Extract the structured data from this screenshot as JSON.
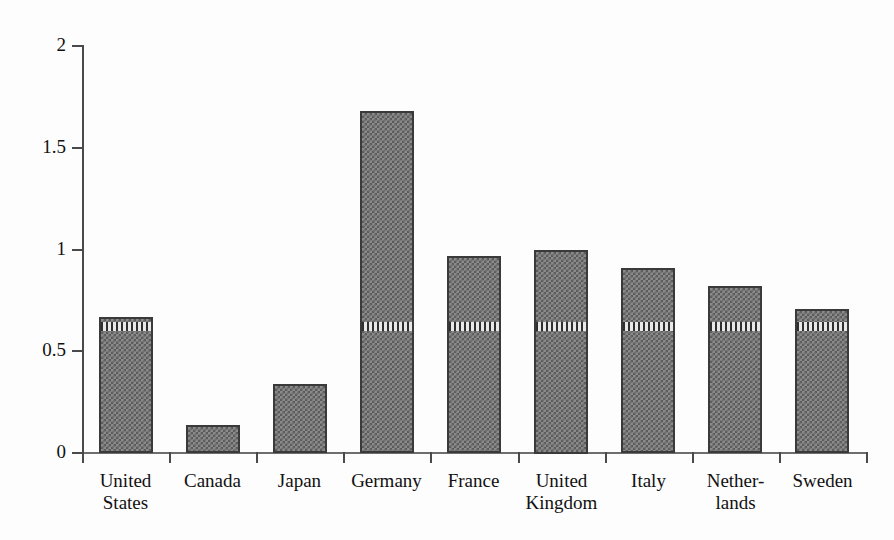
{
  "chart_data": {
    "type": "bar",
    "title": "",
    "subtitle": "",
    "xlabel": "",
    "ylabel": "",
    "categories": [
      "United\nStates",
      "Canada",
      "Japan",
      "Germany",
      "France",
      "United\nKingdom",
      "Italy",
      "Nether-\nlands",
      "Sweden"
    ],
    "values": [
      0.67,
      0.14,
      0.34,
      1.68,
      0.97,
      1.0,
      0.91,
      0.82,
      0.71
    ],
    "series": [
      {
        "name": "value",
        "values": [
          0.67,
          0.14,
          0.34,
          1.68,
          0.97,
          1.0,
          0.91,
          0.82,
          0.71
        ]
      }
    ],
    "ylim": [
      0,
      2
    ],
    "yticks": [
      0,
      0.5,
      1,
      1.5,
      2
    ],
    "ytick_labels": [
      "0",
      "0.5",
      "1",
      "1.5",
      "2"
    ],
    "grid": false,
    "legend": false,
    "legend_position": "none",
    "bar_fill": "#8a8a8a",
    "bar_pattern": "checkerboard",
    "bar_edge_color": "#3a3a3a",
    "axis_color": "#4a4a4a",
    "background_color": "#fdfdfd",
    "annotation_band_value": 0.61,
    "annotation_band_note": "vertical-striped hatch band drawn across bars at approximately 0.61"
  }
}
